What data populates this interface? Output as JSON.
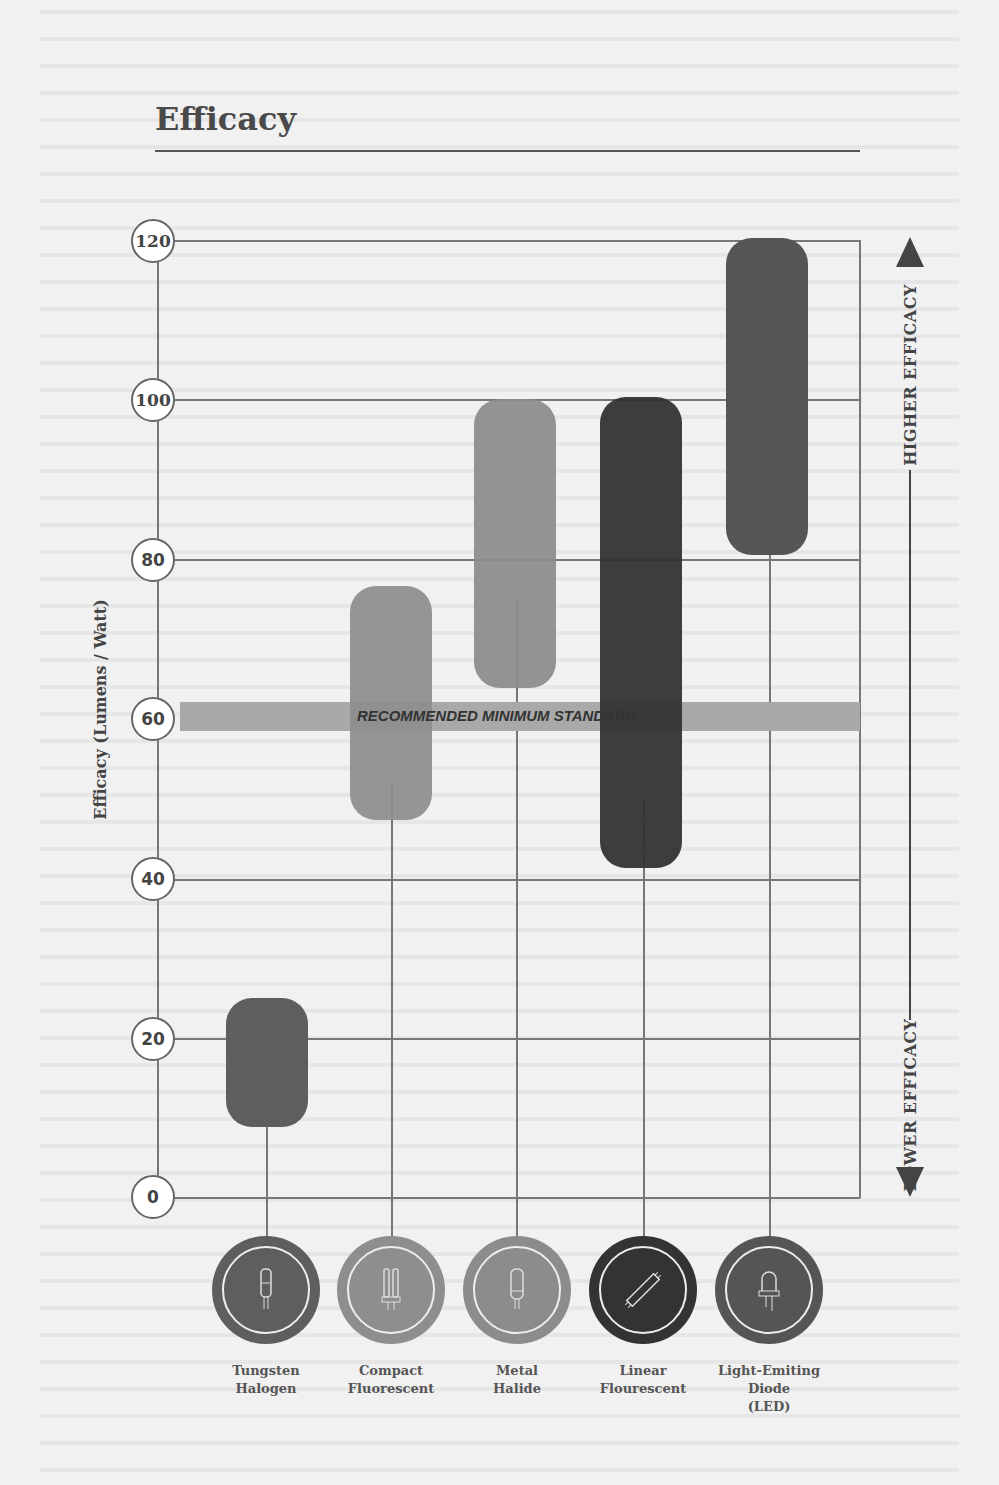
{
  "title": "Efficacy",
  "chart_data": {
    "type": "bar",
    "subtype": "floating-range",
    "title": "Efficacy",
    "ylabel": "Efficacy (Lumens / Watt)",
    "xlabel": "",
    "ylim": [
      0,
      120
    ],
    "yticks": [
      0,
      20,
      40,
      60,
      80,
      100,
      120
    ],
    "grid": true,
    "categories": [
      "Tungsten Halogen",
      "Compact Fluorescent",
      "Metal Halide",
      "Linear Flourescent",
      "Light-Emiting Diode (LED)"
    ],
    "series": [
      {
        "name": "low",
        "values": [
          9,
          48,
          64,
          41,
          80
        ]
      },
      {
        "name": "high",
        "values": [
          25,
          77,
          100,
          100,
          120
        ]
      }
    ],
    "colors": [
      "#5e5e5e",
      "#8e8e8e",
      "#8c8c8c",
      "#333333",
      "#555555"
    ],
    "reference_band": {
      "label": "RECOMMENDED MINIMUM STANDARD",
      "from": 58.5,
      "to": 62,
      "color": "#a9a9a9"
    },
    "annotations": [
      "HIGHER EFFICACY",
      "LOWER EFFICACY"
    ]
  },
  "axis": {
    "ylabel": "Efficacy (Lumens / Watt)",
    "ticks": [
      "120",
      "100",
      "80",
      "60",
      "40",
      "20",
      "0"
    ]
  },
  "band_label": "RECOMMENDED MINIMUM STANDARD",
  "side": {
    "higher": "HIGHER EFFICACY",
    "lower": "LOWER EFFICACY"
  },
  "categories": [
    {
      "line1": "Tungsten",
      "line2": "Halogen",
      "line3": "",
      "icon": "halogen-bulb-icon",
      "color": "#5e5e5e"
    },
    {
      "line1": "Compact",
      "line2": "Fluorescent",
      "line3": "",
      "icon": "cfl-bulb-icon",
      "color": "#8e8e8e"
    },
    {
      "line1": "Metal",
      "line2": "Halide",
      "line3": "",
      "icon": "metal-halide-bulb-icon",
      "color": "#8c8c8c"
    },
    {
      "line1": "Linear",
      "line2": "Flourescent",
      "line3": "",
      "icon": "fluorescent-tube-icon",
      "color": "#333333"
    },
    {
      "line1": "Light-Emiting",
      "line2": "Diode",
      "line3": "(LED)",
      "icon": "led-icon",
      "color": "#555555"
    }
  ]
}
